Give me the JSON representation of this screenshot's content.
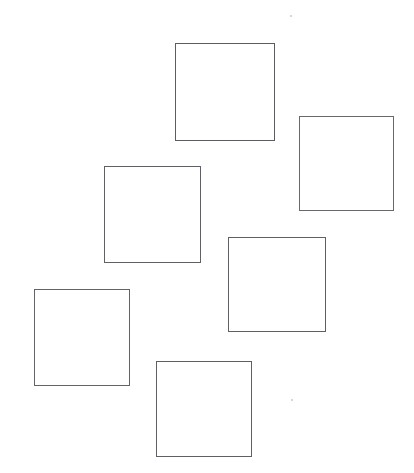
{
  "figure": {
    "title": "Six outlined squares scattered on a white background",
    "background_color": "#ffffff",
    "width": 414,
    "height": 473,
    "stroke_color": "#5f6065",
    "stroke_width": 1,
    "fill": "none",
    "shape_count": "6"
  },
  "shapes": [
    {
      "name": "square-1",
      "label": "Square 1",
      "x": 175,
      "y": 43,
      "width": 100,
      "height": 98,
      "stroke_color": "#56575c",
      "fill": "none"
    },
    {
      "name": "square-2",
      "label": "Square 2",
      "x": 299,
      "y": 116,
      "width": 95,
      "height": 95,
      "stroke_color": "#646569",
      "fill": "none"
    },
    {
      "name": "square-3",
      "label": "Square 3",
      "x": 104,
      "y": 166,
      "width": 97,
      "height": 97,
      "stroke_color": "#5b5c61",
      "fill": "none"
    },
    {
      "name": "square-4",
      "label": "Square 4",
      "x": 228,
      "y": 237,
      "width": 98,
      "height": 95,
      "stroke_color": "#5a5b60",
      "fill": "none"
    },
    {
      "name": "square-5",
      "label": "Square 5",
      "x": 34,
      "y": 289,
      "width": 96,
      "height": 97,
      "stroke_color": "#5d5e63",
      "fill": "none"
    },
    {
      "name": "square-6",
      "label": "Square 6",
      "x": 156,
      "y": 361,
      "width": 96,
      "height": 96,
      "stroke_color": "#5a5b60",
      "fill": "none"
    }
  ],
  "specks": [
    {
      "name": "speck-top",
      "x": 290,
      "y": 15
    },
    {
      "name": "speck-bottom",
      "x": 291,
      "y": 399
    }
  ]
}
